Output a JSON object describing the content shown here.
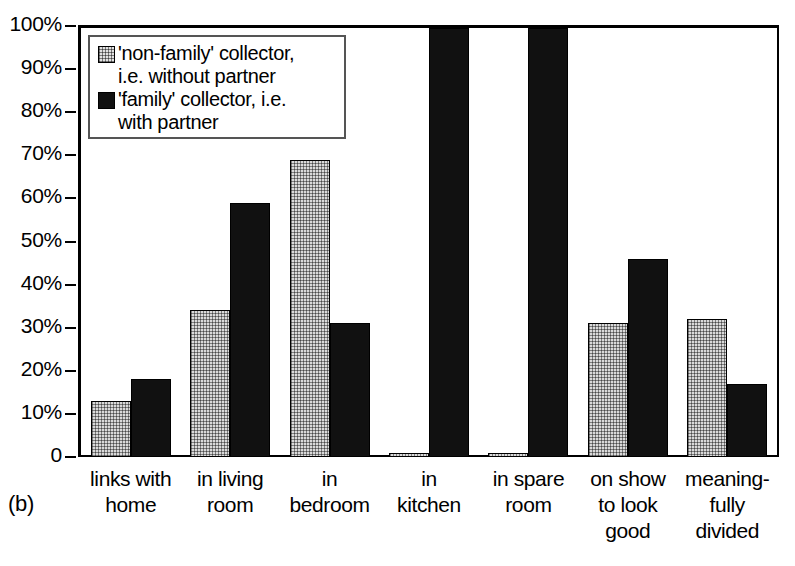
{
  "figure": {
    "panel_label": "(b)"
  },
  "legend": {
    "position": "inside-top-left",
    "entries": [
      {
        "swatch": "light-checkered-swatch",
        "label": "'non-family' collector,\ni.e. without partner"
      },
      {
        "swatch": "dark-solid-swatch",
        "label": "'family' collector, i.e.\nwith partner"
      }
    ]
  },
  "axis": {
    "y_ticks": [
      "0",
      "10%",
      "20%",
      "30%",
      "40%",
      "50%",
      "60%",
      "70%",
      "80%",
      "90%",
      "100%"
    ]
  },
  "chart_data": {
    "type": "bar",
    "title": "",
    "subtitle": "",
    "xlabel": "",
    "ylabel": "",
    "ylim": [
      0,
      100
    ],
    "ytick_values": [
      0,
      10,
      20,
      30,
      40,
      50,
      60,
      70,
      80,
      90,
      100
    ],
    "ytick_labels": [
      "0",
      "10%",
      "20%",
      "30%",
      "40%",
      "50%",
      "60%",
      "70%",
      "80%",
      "90%",
      "100%"
    ],
    "grid": false,
    "legend_position": "upper left (inside axes)",
    "categories": [
      "links with\nhome",
      "in living\nroom",
      "in\nbedroom",
      "in\nkitchen",
      "in spare\nroom",
      "on show\nto look\ngood",
      "meaning-\nfully\ndivided"
    ],
    "series": [
      {
        "name": "'non-family' collector, i.e. without partner",
        "color": "#d9d9d9",
        "pattern": "checkered",
        "values": [
          13,
          34,
          69,
          1,
          1,
          31,
          32
        ]
      },
      {
        "name": "'family' collector, i.e. with partner",
        "color": "#111111",
        "pattern": "solid",
        "values": [
          18,
          59,
          31,
          99.5,
          99.5,
          46,
          17
        ]
      }
    ]
  }
}
